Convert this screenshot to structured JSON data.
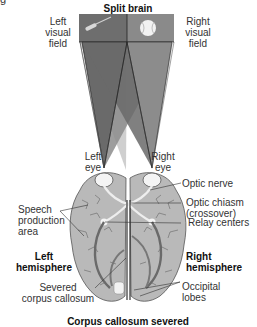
{
  "cutoff_text": "g",
  "title": "Split brain",
  "labels": {
    "left_visual_field": [
      "Left",
      "visual",
      "field"
    ],
    "right_visual_field": [
      "Right",
      "visual",
      "field"
    ],
    "left_eye": [
      "Left",
      "eye"
    ],
    "right_eye": [
      "Right",
      "eye"
    ],
    "optic_nerve": "Optic nerve",
    "optic_chiasm": [
      "Optic chiasm",
      "(crossover)"
    ],
    "speech_area": [
      "Speech",
      "production",
      "area"
    ],
    "relay_centers": "Relay centers",
    "left_hemisphere": [
      "Left",
      "hemisphere"
    ],
    "right_hemisphere": [
      "Right",
      "hemisphere"
    ],
    "severed_cc": [
      "Severed",
      "corpus callosum"
    ],
    "occipital": [
      "Occipital",
      "lobes"
    ]
  },
  "caption": "Corpus callosum severed",
  "objects": {
    "left_field_object": "screwdriver-icon",
    "right_field_object": "baseball-icon"
  },
  "colors": {
    "field_left": "#6e6e6e",
    "field_right": "#8a8a8a",
    "cone_dark": "#6a6a6a",
    "cone_mid": "#8c8c8c",
    "cone_light": "#cfcfcf",
    "brain": "#b9b9b9",
    "brain_line": "#555555"
  }
}
